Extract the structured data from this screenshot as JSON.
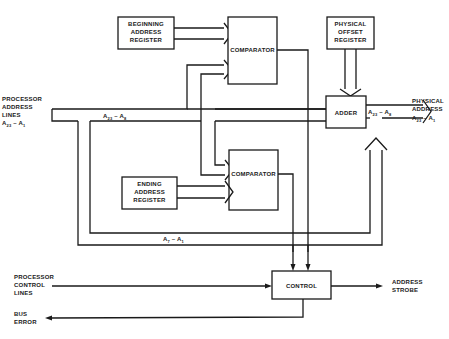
{
  "diagram": {
    "type": "block-diagram",
    "blocks": {
      "beginning_register": [
        "BEGINNING",
        "ADDRESS",
        "REGISTER"
      ],
      "comparator_top": "COMPARATOR",
      "physical_offset_register": [
        "PHYSICAL",
        "OFFSET",
        "REGISTER"
      ],
      "adder": "ADDER",
      "comparator_bottom": "COMPARATOR",
      "ending_register": [
        "ENDING",
        "ADDRESS",
        "REGISTER"
      ],
      "control": "CONTROL"
    },
    "labels": {
      "processor_address": [
        "PROCESSOR",
        "ADDRESS",
        "LINES"
      ],
      "processor_address_range": {
        "a": "A",
        "hi": "23",
        "dash": " – ",
        "b": "A",
        "lo": "1"
      },
      "bus_upper": {
        "a": "A",
        "hi": "23",
        "dash": " – ",
        "b": "A",
        "lo": "8"
      },
      "bus_adder_out": {
        "a": "A",
        "hi": "23",
        "dash": " – ",
        "b": "A",
        "lo": "8"
      },
      "bus_lower": {
        "a": "A",
        "hi": "7",
        "dash": " – ",
        "b": "A",
        "lo": "1"
      },
      "physical_address": [
        "PHYSICAL",
        "ADDRESS"
      ],
      "physical_address_range": {
        "a": "A",
        "hi": "23",
        "dash": " – ",
        "b": "A",
        "lo": "1"
      },
      "processor_control": [
        "PROCESSOR",
        "CONTROL",
        "LINES"
      ],
      "address_strobe": [
        "ADDRESS",
        "STROBE"
      ],
      "bus_error": [
        "BUS",
        "ERROR"
      ]
    },
    "connections": [
      {
        "from": "processor_address_lines",
        "to": "adder",
        "bus": "A23 – A8"
      },
      {
        "from": "beginning_register",
        "to": "comparator_top"
      },
      {
        "from": "processor_address_lines",
        "to": "comparator_top"
      },
      {
        "from": "processor_address_lines",
        "to": "comparator_bottom"
      },
      {
        "from": "ending_register",
        "to": "comparator_bottom"
      },
      {
        "from": "physical_offset_register",
        "to": "adder"
      },
      {
        "from": "adder",
        "to": "physical_address",
        "bus": "A23 – A8"
      },
      {
        "from": "processor_address_lines",
        "to": "physical_address",
        "bus": "A7 – A1"
      },
      {
        "from": "comparator_top",
        "to": "control"
      },
      {
        "from": "comparator_bottom",
        "to": "control"
      },
      {
        "from": "processor_control_lines",
        "to": "control"
      },
      {
        "from": "control",
        "to": "address_strobe"
      },
      {
        "from": "control",
        "to": "bus_error"
      }
    ]
  }
}
